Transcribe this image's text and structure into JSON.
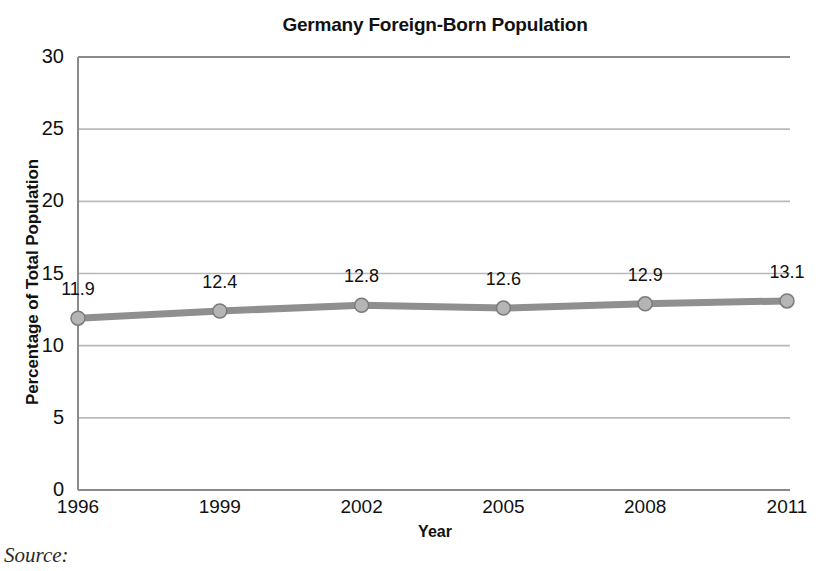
{
  "chart_data": {
    "type": "line",
    "title": "Germany Foreign-Born Population",
    "xlabel": "Year",
    "ylabel": "Percentage of Total Population",
    "categories": [
      "1996",
      "1999",
      "2002",
      "2005",
      "2008",
      "2011"
    ],
    "values": [
      11.9,
      12.4,
      12.8,
      12.6,
      12.9,
      13.1
    ],
    "point_labels": [
      "11.9",
      "12.4",
      "12.8",
      "12.6",
      "12.9",
      "13.1"
    ],
    "ylim": [
      0,
      30
    ],
    "y_ticks": [
      "0",
      "5",
      "10",
      "15",
      "20",
      "25",
      "30"
    ],
    "y_tick_values": [
      0,
      5,
      10,
      15,
      20,
      25,
      30
    ],
    "grid": true,
    "legend": "none",
    "series_name": "Germany Foreign-Born Population",
    "series_color": "#8f8f8f",
    "marker_fill": "#b5b5b5",
    "marker_stroke": "#7a7a7a",
    "grid_color": "#b9b9b9",
    "axis_color": "#8a8a8a",
    "text_color": "#111111"
  },
  "footer": {
    "source_label": "Source:"
  }
}
